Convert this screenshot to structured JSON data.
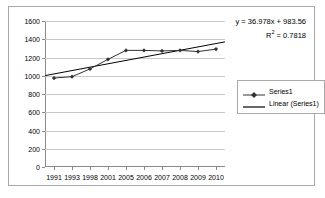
{
  "chart_data": {
    "type": "line",
    "title": "",
    "xlabel": "",
    "ylabel": "",
    "categories": [
      "1991",
      "1993",
      "1998",
      "2001",
      "2005",
      "2006",
      "2007",
      "2008",
      "2009",
      "2010"
    ],
    "series": [
      {
        "name": "Series1",
        "type": "line-with-markers",
        "values": [
          975,
          990,
          1075,
          1180,
          1278,
          1278,
          1272,
          1278,
          1265,
          1292
        ]
      },
      {
        "name": "Linear (Series1)",
        "type": "trendline",
        "values": [
          1020,
          1057,
          1094,
          1131,
          1168,
          1205,
          1242,
          1279,
          1316,
          1353
        ]
      }
    ],
    "ylim": [
      0,
      1600
    ],
    "ytick_values": [
      0,
      200,
      400,
      600,
      800,
      1000,
      1200,
      1400,
      1600
    ],
    "ytick_labels": [
      "0",
      "200",
      "400",
      "600",
      "800",
      "1000",
      "1200",
      "1400",
      "1600"
    ],
    "grid": true,
    "legend_position": "right",
    "annotations": {
      "equation": "y = 36.978x + 983.56",
      "r_squared_prefix": "R",
      "r_squared_exponent": "2",
      "r_squared_value": " = 0.7818"
    },
    "colors": {
      "series_line": "#333333",
      "trendline": "#000000",
      "gridline": "#c9c9c9",
      "axis": "#8a8a8a",
      "border": "#a8a8a8",
      "background": "#ffffff"
    }
  },
  "legend": {
    "items": [
      {
        "label": "Series1",
        "marker": "diamond-marker"
      },
      {
        "label": "Linear (Series1)",
        "marker": "line-marker"
      }
    ]
  }
}
